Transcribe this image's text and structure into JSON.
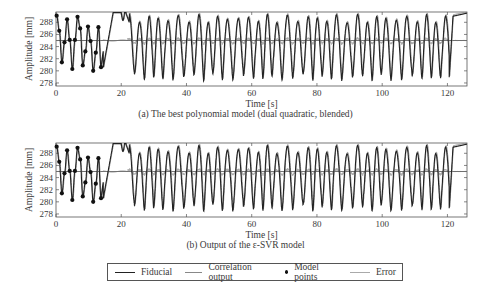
{
  "chart_data": [
    {
      "type": "line",
      "panel": "a",
      "caption": "(a) The best polynomial model (dual quadratic, blended)",
      "xlabel": "Time [s]",
      "ylabel": "Amplitude [mm]",
      "xlim": [
        0,
        126
      ],
      "ylim": [
        277.5,
        289.7
      ],
      "xticks": [
        0,
        20,
        40,
        60,
        80,
        100,
        120
      ],
      "yticks": [
        278,
        280,
        282,
        284,
        286,
        288
      ],
      "grid": false,
      "series": [
        {
          "name": "Fiducial",
          "color": "#222222",
          "style": "line"
        },
        {
          "name": "Correlation output",
          "color": "#777777",
          "style": "line"
        },
        {
          "name": "Model points",
          "color": "#111111",
          "style": "markers",
          "x": [
            0.2,
            1.0,
            1.8,
            2.6,
            3.4,
            4.2,
            5.0,
            5.8,
            6.6,
            7.4,
            8.2,
            9.0,
            9.8,
            10.6,
            11.4,
            12.2,
            13.0,
            13.8
          ],
          "y": [
            289.1,
            286.6,
            281.4,
            284.7,
            288.5,
            285.1,
            280.3,
            285.1,
            288.9,
            287.0,
            280.9,
            283.2,
            287.3,
            284.9,
            280.0,
            283.0,
            287.2,
            280.6
          ]
        },
        {
          "name": "Error",
          "color": "#999999",
          "style": "line"
        }
      ],
      "baseline": 285.0
    },
    {
      "type": "line",
      "panel": "b",
      "caption": "(b) Output of the ε-SVR model",
      "xlabel": "Time [s]",
      "ylabel": "Amplitude [mm]",
      "xlim": [
        0,
        126
      ],
      "ylim": [
        277.5,
        289.7
      ],
      "xticks": [
        0,
        20,
        40,
        60,
        80,
        100,
        120
      ],
      "yticks": [
        278,
        280,
        282,
        284,
        286,
        288
      ],
      "grid": false,
      "series": [
        {
          "name": "Fiducial",
          "color": "#222222",
          "style": "line"
        },
        {
          "name": "Correlation output",
          "color": "#777777",
          "style": "line"
        },
        {
          "name": "Model points",
          "color": "#111111",
          "style": "markers",
          "x": [
            0.2,
            1.0,
            1.8,
            2.6,
            3.4,
            4.2,
            5.0,
            5.8,
            6.6,
            7.4,
            8.2,
            9.0,
            9.8,
            10.6,
            11.4,
            12.2,
            13.0,
            13.8
          ],
          "y": [
            289.1,
            286.6,
            281.4,
            284.7,
            288.5,
            285.1,
            280.3,
            285.1,
            288.9,
            287.0,
            280.9,
            283.2,
            287.3,
            284.9,
            280.0,
            283.0,
            287.2,
            280.6
          ]
        },
        {
          "name": "Error",
          "color": "#999999",
          "style": "line"
        }
      ],
      "baseline": 285.0
    }
  ],
  "figure": {
    "panel_a": {
      "caption": "(a) The best polynomial model (dual quadratic, blended)",
      "xlabel": "Time [s]",
      "ylabel": "Amplitude [mm]"
    },
    "panel_b": {
      "caption": "(b) Output of the ε-SVR model",
      "xlabel": "Time [s]",
      "ylabel": "Amplitude [mm]"
    }
  },
  "legend": {
    "items": [
      {
        "label": "Fiducial",
        "color": "#222222",
        "kind": "line"
      },
      {
        "label": "Correlation output",
        "color": "#888888",
        "kind": "line"
      },
      {
        "label": "Model points",
        "color": "#111111",
        "kind": "dot"
      },
      {
        "label": "Error",
        "color": "#aaaaaa",
        "kind": "line"
      }
    ]
  }
}
